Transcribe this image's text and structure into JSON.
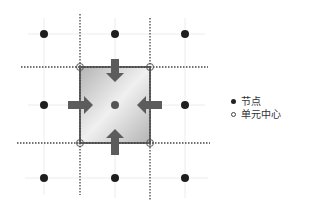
{
  "diagram": {
    "title": "",
    "colors": {
      "node": "#222222",
      "cell_center": "#555555",
      "cell_border": "#666666",
      "arrow": "#5a5a5a",
      "dotted_line": "#444444",
      "grid_line": "#e6e6e6",
      "cell_fill_light": "#f2f2f2",
      "cell_fill_dark": "#b8b8b8"
    },
    "nodes": [
      {
        "x": 44,
        "y": 34
      },
      {
        "x": 115,
        "y": 34
      },
      {
        "x": 185,
        "y": 34
      },
      {
        "x": 44,
        "y": 105
      },
      {
        "x": 185,
        "y": 105
      },
      {
        "x": 44,
        "y": 178
      },
      {
        "x": 115,
        "y": 178
      },
      {
        "x": 185,
        "y": 178
      }
    ],
    "cell": {
      "x": 80,
      "y": 67,
      "width": 70,
      "height": 76,
      "center": {
        "x": 115,
        "y": 105
      }
    },
    "arrows": [
      "top-inward",
      "bottom-inward",
      "left-inward",
      "right-inward"
    ]
  },
  "legend": {
    "items": [
      {
        "marker": "filled-circle",
        "label": "节点"
      },
      {
        "marker": "hollow-circle",
        "label": "单元中心"
      }
    ]
  }
}
